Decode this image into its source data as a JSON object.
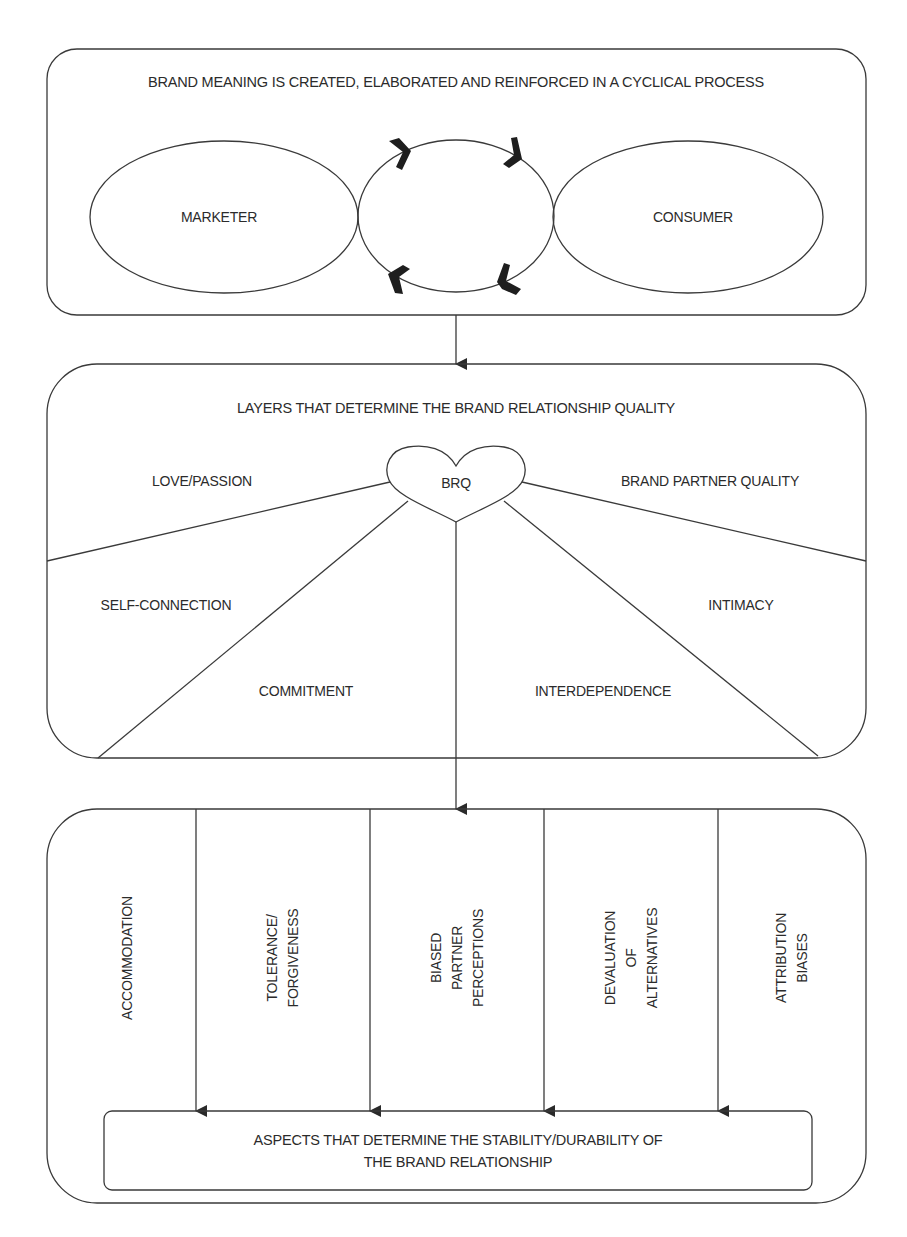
{
  "colors": {
    "stroke": "#3a3a3a",
    "text": "#2b2b2b",
    "background": "#ffffff",
    "chevron": "#1e1e1e"
  },
  "box1": {
    "title": "BRAND MEANING IS CREATED, ELABORATED AND REINFORCED IN A CYCLICAL PROCESS",
    "left_node": "MARKETER",
    "right_node": "CONSUMER",
    "cycle_arrows": [
      "clockwise-top-left",
      "clockwise-top-right",
      "clockwise-bottom-right",
      "clockwise-bottom-left"
    ]
  },
  "box2": {
    "title": "LAYERS THAT DETERMINE THE BRAND RELATIONSHIP QUALITY",
    "center_node": "BRQ",
    "segments": {
      "love_passion": "LOVE/PASSION",
      "brand_partner_quality": "BRAND PARTNER QUALITY",
      "self_connection": "SELF-CONNECTION",
      "intimacy": "INTIMACY",
      "commitment": "COMMITMENT",
      "interdependence": "INTERDEPENDENCE"
    }
  },
  "box3": {
    "columns": [
      {
        "label": "ACCOMMODATION"
      },
      {
        "label": "TOLERANCE/\nFORGIVENESS"
      },
      {
        "label": "BIASED\nPARTNER\nPERCEPTIONS"
      },
      {
        "label": "DEVALUATION\nOF\nALTERNATIVES"
      },
      {
        "label": "ATTRIBUTION\nBIASES"
      }
    ],
    "outcome": {
      "line1": "ASPECTS THAT DETERMINE THE STABILITY/DURABILITY OF",
      "line2": "THE BRAND RELATIONSHIP"
    }
  }
}
